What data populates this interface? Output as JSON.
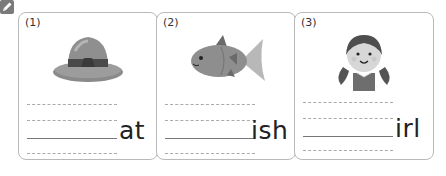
{
  "header": {
    "icon": "pencil-icon"
  },
  "cards": [
    {
      "number": "(1)",
      "picture": "hat",
      "suffix": "at"
    },
    {
      "number": "(2)",
      "picture": "fish",
      "suffix": "ish"
    },
    {
      "number": "(3)",
      "picture": "girl",
      "suffix": "irl"
    }
  ],
  "colors": {
    "border": "#b9b9b9",
    "text": "#222222",
    "dashed": "#aaaaaa",
    "icon_bg": "#7a7a7a"
  }
}
